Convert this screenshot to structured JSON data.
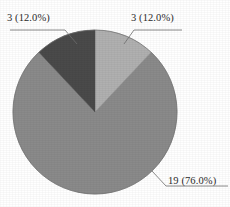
{
  "chart_data": {
    "type": "pie",
    "title": "",
    "subtitle": "",
    "xlabel": "",
    "ylabel": "",
    "grid": false,
    "legend": "none",
    "start_angle_deg": 90,
    "direction": "clockwise",
    "total": 25,
    "categories": [
      "Slice 1",
      "Slice 2",
      "Slice 3"
    ],
    "values": [
      3,
      19,
      3
    ],
    "percentages": [
      12.0,
      76.0,
      12.0
    ],
    "labels": [
      "3 (12.0%)",
      "19 (76.0%)",
      "3 (12.0%)"
    ],
    "colors": [
      "#b0b0b0",
      "#8a8a8a",
      "#4a4a4a"
    ],
    "slices": [
      {
        "label": "3 (12.0%)",
        "value": 3,
        "percent": 12.0,
        "color": "#b0b0b0",
        "start_deg": 0,
        "sweep_deg": 43.2,
        "label_position": "top-right"
      },
      {
        "label": "19 (76.0%)",
        "value": 19,
        "percent": 76.0,
        "color": "#8a8a8a",
        "start_deg": 43.2,
        "sweep_deg": 273.6,
        "label_position": "bottom-right"
      },
      {
        "label": "3 (12.0%)",
        "value": 3,
        "percent": 12.0,
        "color": "#4a4a4a",
        "start_deg": 316.8,
        "sweep_deg": 43.2,
        "label_position": "top-left"
      }
    ]
  },
  "geometry": {
    "center_x": 95,
    "center_y": 112,
    "radius": 82
  },
  "style": {
    "background": "#ffffff",
    "leader_line_color": "#6e6e6e",
    "label_text_color": "#2b2b2b",
    "pie_outline_color": "#6f6f6f"
  },
  "labels": {
    "left_top": "3 (12.0%)",
    "right_top": "3 (12.0%)",
    "right_bottom": "19 (76.0%)"
  }
}
